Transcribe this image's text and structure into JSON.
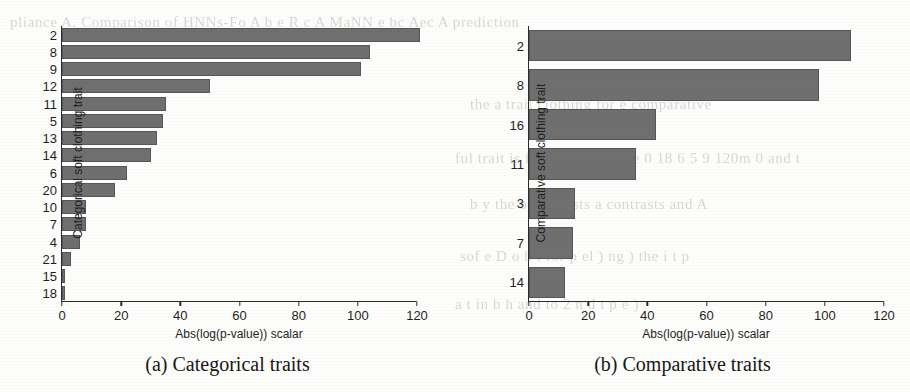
{
  "figure": {
    "background_color": "#fdfdfb",
    "bar_color": "#6f6f6f",
    "axis_color": "#2b2b2b",
    "ghost_text": [
      "pliance A. Comparison of HNNs-Fo  A  b  e  R  c  A  MaNN e  bc  Aec  A  prediction",
      "the a trait clothing for e comparative",
      "ful trait is   for b    N  A  S  P  D  e  0  18  6  5  9  120m  0  and  t",
      "b  y the  b  contrasts  a contrasts  and  A",
      "sof  e  D  o  b  l  for      p  el  )  ng  )  the  i  t  p",
      "a  t  in     b    h  and   to  2  n  d  t  p  e  )"
    ]
  },
  "panels": [
    {
      "id": "panel-a",
      "caption": "(a) Categorical traits",
      "chart_data": {
        "type": "bar",
        "orientation": "horizontal",
        "title": "",
        "xlabel": "Abs(log(p-value)) scalar",
        "ylabel": "Categorical soft clothing trait",
        "xlim": [
          0,
          120
        ],
        "xticks": [
          0,
          20,
          40,
          60,
          80,
          100,
          120
        ],
        "grid": false,
        "legend": "none",
        "categories": [
          "2",
          "8",
          "9",
          "12",
          "11",
          "5",
          "13",
          "14",
          "6",
          "20",
          "10",
          "7",
          "4",
          "21",
          "15",
          "18"
        ],
        "values": [
          121,
          104,
          101,
          50,
          35,
          34,
          32,
          30,
          22,
          18,
          8,
          8,
          6,
          3,
          1,
          1
        ]
      }
    },
    {
      "id": "panel-b",
      "caption": "(b) Comparative traits",
      "chart_data": {
        "type": "bar",
        "orientation": "horizontal",
        "title": "",
        "xlabel": "Abs(log(p-value)) scalar",
        "ylabel": "Comparative soft clothing trait",
        "xlim": [
          0,
          120
        ],
        "xticks": [
          0,
          20,
          40,
          60,
          80,
          100,
          120
        ],
        "grid": false,
        "legend": "none",
        "categories": [
          "2",
          "8",
          "16",
          "11",
          "3",
          "7",
          "14"
        ],
        "values": [
          109,
          98,
          43,
          36,
          15.7,
          15,
          12
        ]
      }
    }
  ]
}
